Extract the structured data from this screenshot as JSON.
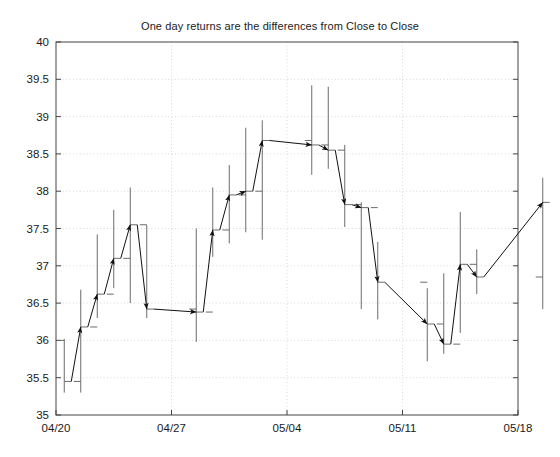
{
  "chart_data": {
    "type": "line",
    "title": "One day returns are the differences from Close to Close",
    "xlabel": "",
    "ylabel": "",
    "ylim": [
      35,
      40
    ],
    "ytick_values": [
      35,
      35.5,
      36,
      36.5,
      37,
      37.5,
      38,
      38.5,
      39,
      39.5,
      40
    ],
    "ytick_labels": [
      "35",
      "35.5",
      "36",
      "36.5",
      "37",
      "37.5",
      "38",
      "38.5",
      "39",
      "39.5",
      "40"
    ],
    "xtick_labels": [
      "04/20",
      "04/27",
      "05/04",
      "05/11",
      "05/18"
    ],
    "xtick_days": [
      0,
      7,
      14,
      21,
      28
    ],
    "xlim_days": [
      0,
      28
    ],
    "grid": true,
    "legend": null,
    "series_note": "HLC bars (high-low vertical line with left open tick and right close tick) plus arrows connecting each close to the next close",
    "bars": [
      {
        "day": 0.5,
        "high": 36.02,
        "low": 35.3,
        "open": 36.0,
        "close": 35.45
      },
      {
        "day": 1.5,
        "high": 36.68,
        "low": 35.3,
        "open": 35.45,
        "close": 36.18
      },
      {
        "day": 2.5,
        "high": 37.42,
        "low": 36.3,
        "open": 36.18,
        "close": 36.62
      },
      {
        "day": 3.5,
        "high": 37.75,
        "low": 36.7,
        "open": 36.62,
        "close": 37.1
      },
      {
        "day": 4.5,
        "high": 38.05,
        "low": 36.5,
        "open": 37.1,
        "close": 37.55
      },
      {
        "day": 5.5,
        "high": 37.55,
        "low": 36.3,
        "open": 37.55,
        "close": 36.42
      },
      {
        "day": 8.5,
        "high": 37.5,
        "low": 35.98,
        "open": 36.42,
        "close": 36.38
      },
      {
        "day": 9.5,
        "high": 38.05,
        "low": 37.12,
        "open": 36.38,
        "close": 37.48
      },
      {
        "day": 10.5,
        "high": 38.35,
        "low": 37.3,
        "open": 37.48,
        "close": 37.95
      },
      {
        "day": 11.5,
        "high": 38.85,
        "low": 37.45,
        "open": 37.95,
        "close": 38.0
      },
      {
        "day": 12.5,
        "high": 38.95,
        "low": 37.35,
        "open": 38.0,
        "close": 38.68
      },
      {
        "day": 15.5,
        "high": 39.42,
        "low": 38.22,
        "open": 38.68,
        "close": 38.62
      },
      {
        "day": 16.5,
        "high": 39.4,
        "low": 38.3,
        "open": 38.62,
        "close": 38.55
      },
      {
        "day": 17.5,
        "high": 38.62,
        "low": 37.52,
        "open": 38.55,
        "close": 37.82
      },
      {
        "day": 18.5,
        "high": 37.85,
        "low": 36.42,
        "open": 37.82,
        "close": 37.78
      },
      {
        "day": 19.5,
        "high": 37.32,
        "low": 36.28,
        "open": 37.78,
        "close": 36.78
      },
      {
        "day": 22.5,
        "high": 36.7,
        "low": 35.72,
        "open": 36.78,
        "close": 36.22
      },
      {
        "day": 23.5,
        "high": 36.9,
        "low": 35.82,
        "open": 36.22,
        "close": 35.95
      },
      {
        "day": 24.5,
        "high": 37.72,
        "low": 36.1,
        "open": 35.95,
        "close": 37.02
      },
      {
        "day": 25.5,
        "high": 37.22,
        "low": 36.62,
        "open": 37.02,
        "close": 36.85
      },
      {
        "day": 29.5,
        "high": 38.18,
        "low": 36.42,
        "open": 36.85,
        "close": 37.85
      }
    ]
  }
}
